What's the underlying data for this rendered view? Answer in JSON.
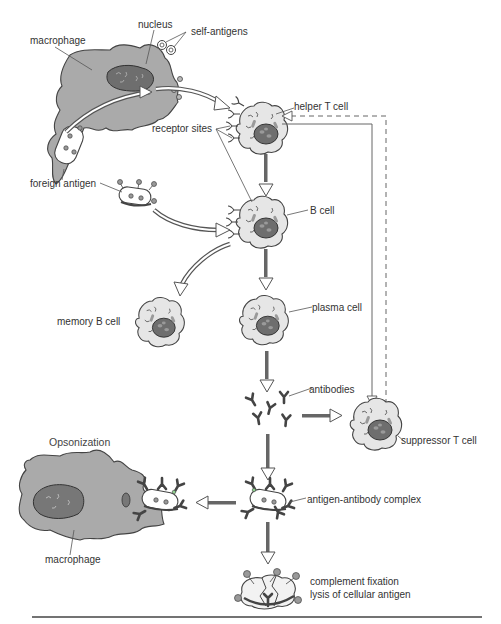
{
  "diagram": {
    "title": "Opsonization",
    "colors": {
      "macrophage": "#aaaaaa",
      "nucleus": "#777777",
      "cell_fill": "#e8e8e8",
      "cell_nucleus": "#6e6e6e",
      "line": "#555555",
      "arrow_fill": "#ffffff",
      "complement_ball": "#999999"
    },
    "labels": {
      "macrophage_top": "macrophage",
      "nucleus": "nucleus",
      "self_antigens": "self-antigens",
      "receptor_sites": "receptor sites",
      "helper_t_cell": "helper T cell",
      "foreign_antigen": "foreign antigen",
      "b_cell": "B cell",
      "memory_b_cell": "memory B cell",
      "plasma_cell": "plasma cell",
      "antibodies": "antibodies",
      "suppressor_t_cell": "suppressor T cell",
      "opsonization": "Opsonization",
      "macrophage_bottom": "macrophage",
      "antigen_antibody_complex": "antigen-antibody complex",
      "complement_fixation": "complement fixation",
      "lysis": "lysis of cellular antigen"
    },
    "nodes": [
      {
        "id": "macrophage",
        "label": "macrophage"
      },
      {
        "id": "helper-t-cell",
        "label": "helper T cell"
      },
      {
        "id": "foreign-antigen",
        "label": "foreign antigen"
      },
      {
        "id": "b-cell",
        "label": "B cell"
      },
      {
        "id": "memory-b-cell",
        "label": "memory B cell"
      },
      {
        "id": "plasma-cell",
        "label": "plasma cell"
      },
      {
        "id": "antibodies",
        "label": "antibodies"
      },
      {
        "id": "suppressor-t-cell",
        "label": "suppressor T cell"
      },
      {
        "id": "antigen-antibody-complex",
        "label": "antigen-antibody complex"
      },
      {
        "id": "opsonization-macrophage",
        "label": "macrophage"
      },
      {
        "id": "complement-fixation",
        "label": "complement fixation / lysis of cellular antigen"
      }
    ],
    "edges": [
      {
        "from": "macrophage",
        "to": "helper-t-cell",
        "style": "curved-hollow-arrow"
      },
      {
        "from": "helper-t-cell",
        "to": "b-cell",
        "style": "solid-arrow"
      },
      {
        "from": "foreign-antigen",
        "to": "b-cell",
        "style": "curved-hollow-arrow"
      },
      {
        "from": "b-cell",
        "to": "memory-b-cell",
        "style": "curved-hollow-arrow"
      },
      {
        "from": "b-cell",
        "to": "plasma-cell",
        "style": "solid-arrow"
      },
      {
        "from": "plasma-cell",
        "to": "antibodies",
        "style": "solid-arrow"
      },
      {
        "from": "antibodies",
        "to": "suppressor-t-cell",
        "style": "solid-arrow"
      },
      {
        "from": "helper-t-cell",
        "to": "suppressor-t-cell",
        "style": "thin-line-arrow"
      },
      {
        "from": "suppressor-t-cell",
        "to": "helper-t-cell",
        "style": "dashed-line-arrow"
      },
      {
        "from": "antibodies",
        "to": "antigen-antibody-complex",
        "style": "solid-arrow"
      },
      {
        "from": "antigen-antibody-complex",
        "to": "opsonization-macrophage",
        "style": "solid-arrow"
      },
      {
        "from": "antigen-antibody-complex",
        "to": "complement-fixation",
        "style": "solid-arrow"
      }
    ]
  }
}
